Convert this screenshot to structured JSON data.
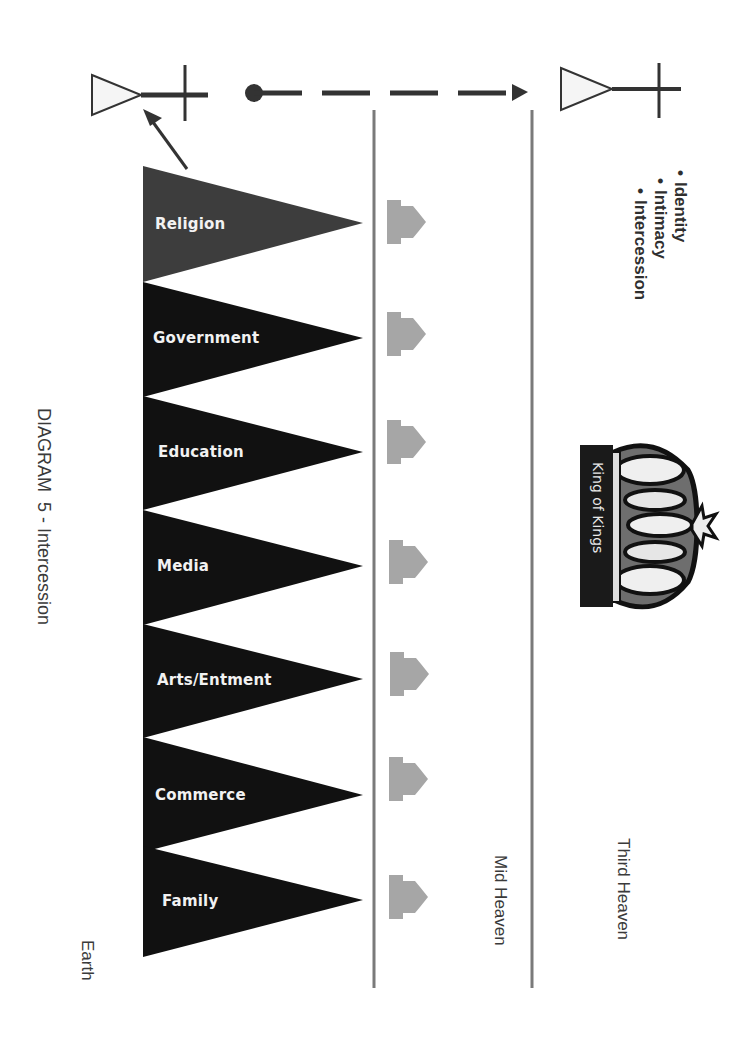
{
  "title": "DIAGRAM  5 - Intercession",
  "realms": {
    "earth": "Earth",
    "mid_heaven": "Mid Heaven",
    "third_heaven": "Third Heaven"
  },
  "bullets": [
    "Identity",
    "Intimacy",
    "Intercession"
  ],
  "crown": {
    "banner_text": "King of Kings"
  },
  "pennants": [
    {
      "label": "Religion",
      "color": "#3d3d3d"
    },
    {
      "label": "Government",
      "color": "#111111"
    },
    {
      "label": "Education",
      "color": "#111111"
    },
    {
      "label": "Media",
      "color": "#111111"
    },
    {
      "label": "Arts/Entment",
      "color": "#111111"
    },
    {
      "label": "Commerce",
      "color": "#111111"
    },
    {
      "label": "Family",
      "color": "#111111"
    }
  ],
  "colors": {
    "divider": "#7a7a7a",
    "stronghold": "#a6a6a6",
    "line": "#333333"
  },
  "connector": {
    "style": "dashed-arrow",
    "from": "earth-antenna",
    "to": "third-heaven-antenna"
  }
}
